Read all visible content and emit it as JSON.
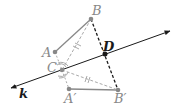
{
  "diagram": {
    "type": "geometry-reflection",
    "points": {
      "A": {
        "label": "A",
        "x": 55,
        "y": 52
      },
      "B": {
        "label": "B",
        "x": 91,
        "y": 19
      },
      "C": {
        "label": "C",
        "x": 62,
        "y": 70
      },
      "D": {
        "label": "D",
        "x": 105,
        "y": 54
      },
      "A_prime": {
        "label": "A′",
        "x": 69,
        "y": 89
      },
      "B_prime": {
        "label": "B′",
        "x": 118,
        "y": 90
      }
    },
    "line": {
      "label": "k"
    },
    "colors": {
      "gray": "#888888",
      "dark": "#1a1a1a",
      "light_gray": "#aaaaaa"
    }
  }
}
